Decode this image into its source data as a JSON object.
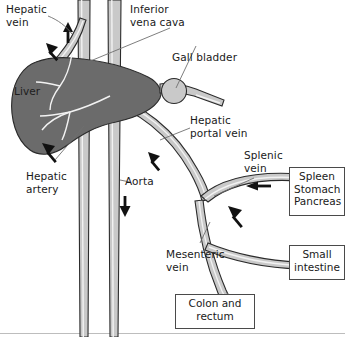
{
  "figure": {
    "background_color": "#ffffff",
    "width": 345,
    "height": 337
  },
  "colors": {
    "vessel_fill": "#c9c9c9",
    "vessel_outline": "#2b2b2b",
    "vessel_highlight": "#f2f2f2",
    "organ_fill": "#6b6b6b",
    "organ_outline": "#2b2b2b",
    "text": "#1a1a1a",
    "box_border": "#4a4a4a",
    "leader_line": "#6f6f6f",
    "frame_line": "#bdbdbd",
    "arrow": "#111111"
  },
  "labels": {
    "hepatic_vein": "Hepatic\nvein",
    "inferior_vena_cava": "Inferior\nvena cava",
    "gall_bladder": "Gall bladder",
    "hepatic_portal_vein": "Hepatic\nportal vein",
    "liver": "Liver",
    "hepatic_artery": "Hepatic\nartery",
    "aorta": "Aorta",
    "splenic_vein": "Splenic\nvein",
    "mesenteric_vein": "Mesenteric\nvein"
  },
  "organ_boxes": [
    {
      "id": "spleen-stomach-pancreas",
      "text": "Spleen\nStomach\nPancreas"
    },
    {
      "id": "small-intestine",
      "text": "Small\nintestine"
    },
    {
      "id": "colon-and-rectum",
      "text": "Colon and\nrectum"
    }
  ],
  "flow_arrows": [
    {
      "id": "hepatic-vein-flow",
      "direction": "up"
    },
    {
      "id": "aorta-flow",
      "direction": "down"
    },
    {
      "id": "hepatic-artery-flow",
      "direction": "up-left"
    },
    {
      "id": "portal-vein-flow",
      "direction": "up-left"
    },
    {
      "id": "splenic-vein-flow",
      "direction": "left"
    },
    {
      "id": "mesenteric-vein-flow",
      "direction": "up-left"
    }
  ]
}
